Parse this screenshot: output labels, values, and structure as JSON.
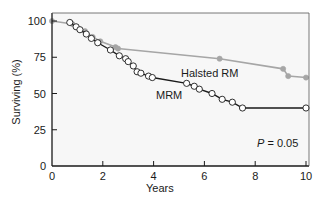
{
  "chart_data": {
    "type": "line",
    "title": "",
    "xlabel": "Years",
    "ylabel": "Surviving (%)",
    "xlim": [
      0,
      10
    ],
    "ylim": [
      0,
      100
    ],
    "x_ticks": [
      0,
      2,
      4,
      6,
      8,
      10
    ],
    "y_ticks": [
      0,
      25,
      50,
      75,
      100
    ],
    "grid": false,
    "annotation": {
      "prefix": "P",
      "text": " = 0.05"
    },
    "series": [
      {
        "name": "Halsted RM",
        "color": "#a6a6a6",
        "marker": "filled-circle",
        "x": [
          0.0,
          0.8,
          1.3,
          1.6,
          1.9,
          2.5,
          2.6,
          6.6,
          9.1,
          9.3,
          10.0
        ],
        "y": [
          100,
          98,
          93,
          89,
          86,
          82,
          81,
          74,
          67,
          62,
          61
        ]
      },
      {
        "name": "MRM",
        "color": "#1a1a1a",
        "marker": "open-circle",
        "x": [
          0.7,
          0.95,
          1.1,
          1.35,
          1.55,
          1.8,
          2.3,
          2.65,
          2.9,
          3.0,
          3.2,
          3.35,
          3.5,
          3.8,
          3.95,
          5.3,
          5.6,
          5.8,
          6.3,
          6.7,
          7.1,
          7.5,
          10.0
        ],
        "y": [
          99,
          96,
          94,
          91,
          88,
          85,
          80,
          76,
          74,
          72,
          69,
          65,
          64,
          62,
          61,
          57,
          55,
          53,
          50,
          46,
          44,
          40,
          40
        ]
      }
    ],
    "series_labels": [
      {
        "text": "Halsted RM",
        "x": 5.0,
        "y": 79
      },
      {
        "text": "MRM",
        "x": 4.1,
        "y": 47
      }
    ]
  }
}
